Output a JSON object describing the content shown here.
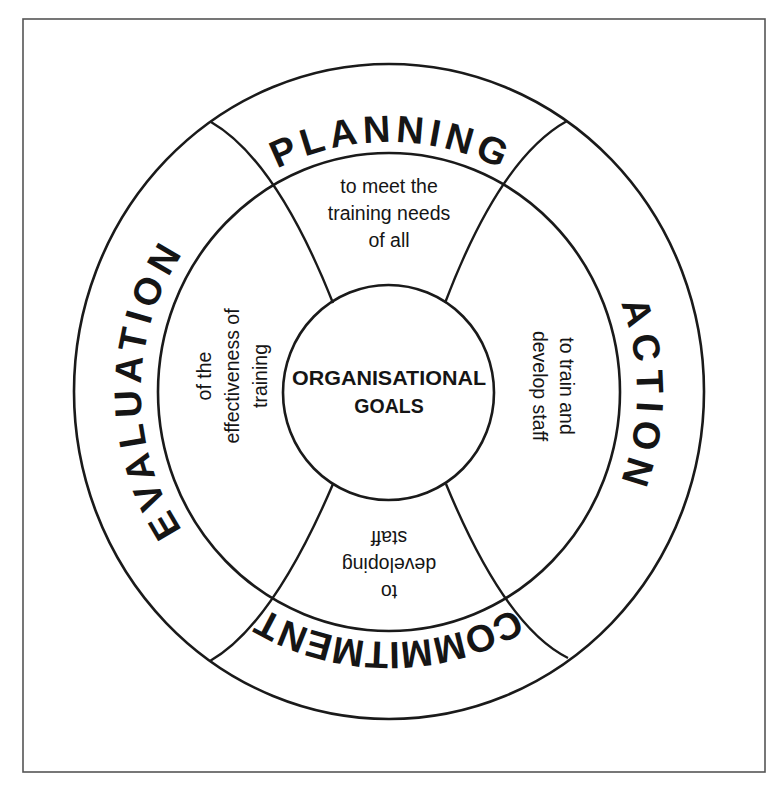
{
  "diagram": {
    "type": "concentric-cycle",
    "center": {
      "lines": [
        "ORGANISATIONAL",
        "GOALS"
      ]
    },
    "outer_ring": {
      "top": "PLANNING",
      "right": "ACTION",
      "bottom": "COMMITMENT",
      "left": "EVALUATION"
    },
    "middle_ring": {
      "top": {
        "lines": [
          "to meet the",
          "training needs",
          "of all"
        ]
      },
      "right": {
        "lines": [
          "to train and",
          "develop staff"
        ]
      },
      "bottom": {
        "lines": [
          "to",
          "developing",
          "staff"
        ]
      },
      "left": {
        "lines": [
          "of the",
          "effectiveness of",
          "training"
        ]
      }
    },
    "colors": {
      "line": "#1a1a1a",
      "text": "#151515",
      "frame": "#555555",
      "background": "#ffffff"
    }
  }
}
